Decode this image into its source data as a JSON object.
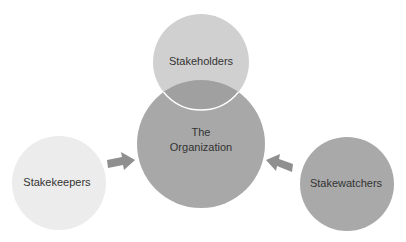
{
  "diagram": {
    "nodes": [
      {
        "id": "organization",
        "label_lines": [
          "The",
          "Organization"
        ],
        "color": "#a8a8a8"
      },
      {
        "id": "stakeholders",
        "label": "Stakeholders",
        "color": "#d0d0d0"
      },
      {
        "id": "stakekeepers",
        "label": "Stakekeepers",
        "color": "#ececec"
      },
      {
        "id": "stakewatchers",
        "label": "Stakewatchers",
        "color": "#a9a9a9"
      }
    ],
    "edges": [
      {
        "from": "stakekeepers",
        "to": "organization",
        "type": "arrow"
      },
      {
        "from": "stakewatchers",
        "to": "organization",
        "type": "arrow"
      }
    ],
    "arrow_color": "#8f8f8f",
    "overlap": {
      "between": [
        "stakeholders",
        "organization"
      ],
      "color": "#9e9e9e"
    }
  }
}
